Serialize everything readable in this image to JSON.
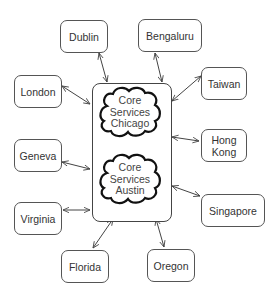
{
  "diagram": {
    "core": {
      "clouds": [
        {
          "line1": "Core",
          "line2": "Services",
          "line3": "Chicago"
        },
        {
          "line1": "Core",
          "line2": "Services",
          "line3": "Austin"
        }
      ]
    },
    "nodes": [
      {
        "id": "dublin",
        "label": "Dublin"
      },
      {
        "id": "bengaluru",
        "label": "Bengaluru"
      },
      {
        "id": "taiwan",
        "label": "Taiwan"
      },
      {
        "id": "london",
        "label": "London"
      },
      {
        "id": "hong-kong",
        "label": "Hong Kong",
        "line1": "Hong",
        "line2": "Kong"
      },
      {
        "id": "geneva",
        "label": "Geneva"
      },
      {
        "id": "singapore",
        "label": "Singapore"
      },
      {
        "id": "virginia",
        "label": "Virginia"
      },
      {
        "id": "florida",
        "label": "Florida"
      },
      {
        "id": "oregon",
        "label": "Oregon"
      }
    ],
    "edges": [
      {
        "from": "dublin",
        "to": "core",
        "bidirectional": true
      },
      {
        "from": "bengaluru",
        "to": "core",
        "bidirectional": true
      },
      {
        "from": "taiwan",
        "to": "core",
        "bidirectional": true
      },
      {
        "from": "london",
        "to": "core",
        "bidirectional": true
      },
      {
        "from": "hong-kong",
        "to": "core",
        "bidirectional": true
      },
      {
        "from": "geneva",
        "to": "core",
        "bidirectional": true
      },
      {
        "from": "singapore",
        "to": "core",
        "bidirectional": true
      },
      {
        "from": "virginia",
        "to": "core",
        "bidirectional": true
      },
      {
        "from": "florida",
        "to": "core",
        "bidirectional": true
      },
      {
        "from": "oregon",
        "to": "core",
        "bidirectional": true
      }
    ],
    "colors": {
      "stroke": "#444444",
      "text": "#333333",
      "background": "#ffffff"
    }
  }
}
